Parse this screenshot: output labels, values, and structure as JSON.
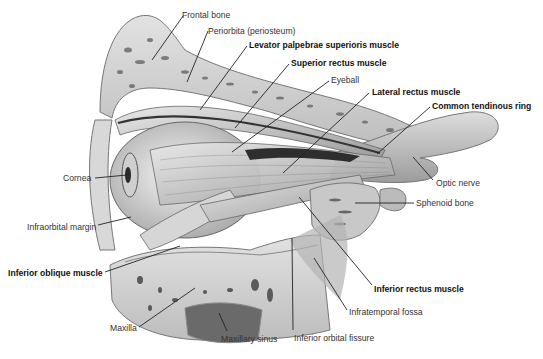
{
  "figure": {
    "labels": [
      {
        "id": "frontal-bone",
        "text": "Frontal bone",
        "bold": false,
        "x": 182,
        "y": 10,
        "lx1": 183,
        "ly1": 16,
        "lx2": 152,
        "ly2": 60
      },
      {
        "id": "periorbita",
        "text": "Periorbita (periosteum)",
        "bold": false,
        "x": 208,
        "y": 26,
        "lx1": 208,
        "ly1": 31,
        "lx2": 187,
        "ly2": 82
      },
      {
        "id": "levator",
        "text": "Levator palpebrae superioris muscle",
        "bold": true,
        "x": 249,
        "y": 40,
        "lx1": 247,
        "ly1": 46,
        "lx2": 200,
        "ly2": 110
      },
      {
        "id": "superior-rectus",
        "text": "Superior rectus muscle",
        "bold": true,
        "x": 291,
        "y": 58,
        "lx1": 289,
        "ly1": 64,
        "lx2": 235,
        "ly2": 128
      },
      {
        "id": "eyeball",
        "text": "Eyeball",
        "bold": false,
        "x": 331,
        "y": 75,
        "lx1": 329,
        "ly1": 81,
        "lx2": 232,
        "ly2": 152
      },
      {
        "id": "lateral-rectus",
        "text": "Lateral rectus muscle",
        "bold": true,
        "x": 372,
        "y": 87,
        "lx1": 369,
        "ly1": 93,
        "lx2": 283,
        "ly2": 173
      },
      {
        "id": "common-tendinous-ring",
        "text": "Common tendinous ring",
        "bold": true,
        "x": 432,
        "y": 101,
        "lx1": 430,
        "ly1": 107,
        "lx2": 377,
        "ly2": 154
      },
      {
        "id": "cornea",
        "text": "Cornea",
        "bold": false,
        "x": 63,
        "y": 173,
        "lx1": 95,
        "ly1": 178,
        "lx2": 127,
        "ly2": 175
      },
      {
        "id": "optic-nerve",
        "text": "Optic nerve",
        "bold": false,
        "x": 436,
        "y": 178,
        "lx1": 433,
        "ly1": 180,
        "lx2": 413,
        "ly2": 157
      },
      {
        "id": "sphenoid-bone",
        "text": "Sphenoid bone",
        "bold": false,
        "x": 416,
        "y": 198,
        "lx1": 414,
        "ly1": 203,
        "lx2": 355,
        "ly2": 203
      },
      {
        "id": "infraorbital-margin",
        "text": "Infraorbital margin",
        "bold": false,
        "x": 27,
        "y": 222,
        "lx1": 98,
        "ly1": 225,
        "lx2": 131,
        "ly2": 217
      },
      {
        "id": "inferior-oblique",
        "text": "Inferior oblique muscle",
        "bold": true,
        "x": 8,
        "y": 268,
        "lx1": 105,
        "ly1": 272,
        "lx2": 180,
        "ly2": 246
      },
      {
        "id": "inferior-rectus",
        "text": "Inferior rectus muscle",
        "bold": true,
        "x": 374,
        "y": 284,
        "lx1": 372,
        "ly1": 285,
        "lx2": 299,
        "ly2": 197
      },
      {
        "id": "infratemporal-fossa",
        "text": "Infratemporal fossa",
        "bold": false,
        "x": 349,
        "y": 307,
        "lx1": 347,
        "ly1": 310,
        "lx2": 314,
        "ly2": 258
      },
      {
        "id": "maxilla",
        "text": "Maxilla",
        "bold": false,
        "x": 110,
        "y": 323,
        "lx1": 139,
        "ly1": 327,
        "lx2": 195,
        "ly2": 288
      },
      {
        "id": "maxillary-sinus",
        "text": "Maxillary sinus",
        "bold": false,
        "x": 221,
        "y": 334,
        "lx1": 227,
        "ly1": 331,
        "lx2": 219,
        "ly2": 313
      },
      {
        "id": "inferior-orbital-fissure",
        "text": "Inferior orbital fissure",
        "bold": false,
        "x": 294,
        "y": 333,
        "lx1": 293,
        "ly1": 330,
        "lx2": 292,
        "ly2": 238
      }
    ]
  },
  "colors": {
    "background": "#ffffff",
    "bone": "#cfcfcf",
    "bone_pore": "#6a6a6a",
    "muscle": "#b9b9b9",
    "muscle_dark": "#8a8a8a",
    "eyeball": "#e6e6e6",
    "shadow": "#2e2e2e",
    "leader": "#222222"
  }
}
